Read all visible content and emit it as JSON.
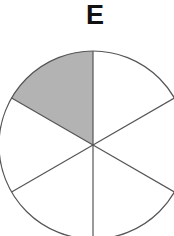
{
  "title": "E",
  "diagram": {
    "type": "pie-fraction",
    "sectors_total": 6,
    "sectors_shaded": 1,
    "shaded_position": "top-left",
    "colors": {
      "shaded": "#b3b3b3",
      "unshaded": "#ffffff",
      "stroke": "#555555"
    }
  }
}
